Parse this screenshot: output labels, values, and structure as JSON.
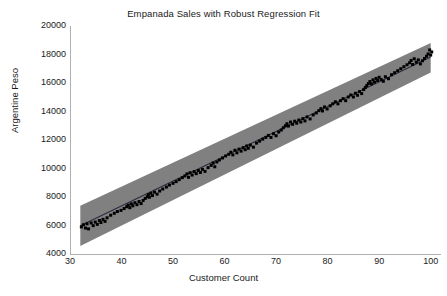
{
  "chart_data": {
    "type": "scatter",
    "title": "Empanada Sales with Robust Regression Fit",
    "xlabel": "Customer Count",
    "ylabel": "Argentine Peso",
    "xlim": [
      30,
      102
    ],
    "ylim": [
      4000,
      20000
    ],
    "xticks": [
      30,
      40,
      50,
      60,
      70,
      80,
      90,
      100
    ],
    "xtick_labels": [
      "30",
      "40",
      "50",
      "60",
      "70",
      "80",
      "90",
      "100"
    ],
    "yticks": [
      4000,
      6000,
      8000,
      10000,
      12000,
      14000,
      16000,
      18000,
      20000
    ],
    "ytick_labels": [
      "4000",
      "6000",
      "8000",
      "10000",
      "12000",
      "14000",
      "16000",
      "18000",
      "20000"
    ],
    "grid": false,
    "legend": null,
    "colors": {
      "band": "#808080",
      "point": "#000000",
      "line": "#2b2b3c",
      "axis": "#b0b0b0",
      "background": "#ffffff",
      "text": "#1a1a1a"
    },
    "series": [
      {
        "name": "Empanada sales observations",
        "type": "scatter",
        "marker": "square",
        "points": [
          [
            32.2,
            5900
          ],
          [
            32.6,
            6050
          ],
          [
            33.0,
            5820
          ],
          [
            33.3,
            6120
          ],
          [
            33.6,
            5760
          ],
          [
            34.1,
            6180
          ],
          [
            34.5,
            5990
          ],
          [
            34.9,
            6240
          ],
          [
            35.3,
            6080
          ],
          [
            35.7,
            6350
          ],
          [
            36.0,
            6210
          ],
          [
            36.4,
            6430
          ],
          [
            36.8,
            6290
          ],
          [
            37.2,
            6540
          ],
          [
            37.9,
            6720
          ],
          [
            38.6,
            6860
          ],
          [
            39.2,
            6980
          ],
          [
            39.9,
            7060
          ],
          [
            40.5,
            7190
          ],
          [
            41.0,
            7320
          ],
          [
            41.3,
            7430
          ],
          [
            41.6,
            7250
          ],
          [
            41.9,
            7520
          ],
          [
            42.2,
            7380
          ],
          [
            42.6,
            7600
          ],
          [
            43.0,
            7460
          ],
          [
            43.4,
            7680
          ],
          [
            43.8,
            7540
          ],
          [
            44.2,
            7760
          ],
          [
            44.6,
            7900
          ],
          [
            45.0,
            8020
          ],
          [
            45.2,
            8160
          ],
          [
            45.4,
            7980
          ],
          [
            45.7,
            8260
          ],
          [
            46.0,
            8100
          ],
          [
            46.4,
            8340
          ],
          [
            46.9,
            8200
          ],
          [
            47.4,
            8420
          ],
          [
            48.0,
            8560
          ],
          [
            48.7,
            8700
          ],
          [
            49.3,
            8840
          ],
          [
            50.0,
            8960
          ],
          [
            50.6,
            9080
          ],
          [
            51.2,
            9220
          ],
          [
            51.8,
            9360
          ],
          [
            52.3,
            9480
          ],
          [
            52.7,
            9620
          ],
          [
            53.0,
            9380
          ],
          [
            53.3,
            9700
          ],
          [
            53.7,
            9540
          ],
          [
            54.1,
            9780
          ],
          [
            54.5,
            9640
          ],
          [
            54.9,
            9860
          ],
          [
            55.3,
            9720
          ],
          [
            55.7,
            9940
          ],
          [
            56.2,
            9800
          ],
          [
            56.8,
            10060
          ],
          [
            57.4,
            10220
          ],
          [
            57.8,
            10380
          ],
          [
            58.1,
            10120
          ],
          [
            58.5,
            10460
          ],
          [
            59.0,
            10600
          ],
          [
            59.6,
            10740
          ],
          [
            60.2,
            10880
          ],
          [
            60.8,
            11000
          ],
          [
            61.2,
            11140
          ],
          [
            61.6,
            10960
          ],
          [
            62.0,
            11280
          ],
          [
            62.4,
            11100
          ],
          [
            62.8,
            11360
          ],
          [
            63.2,
            11220
          ],
          [
            63.6,
            11460
          ],
          [
            64.0,
            11320
          ],
          [
            64.3,
            11580
          ],
          [
            64.6,
            11420
          ],
          [
            65.0,
            11640
          ],
          [
            65.6,
            11500
          ],
          [
            66.2,
            11780
          ],
          [
            66.8,
            11920
          ],
          [
            67.4,
            12060
          ],
          [
            68.0,
            12180
          ],
          [
            68.5,
            12320
          ],
          [
            69.0,
            12180
          ],
          [
            69.5,
            12440
          ],
          [
            70.0,
            12300
          ],
          [
            70.5,
            12560
          ],
          [
            71.0,
            12700
          ],
          [
            71.4,
            12860
          ],
          [
            71.8,
            13000
          ],
          [
            72.1,
            13140
          ],
          [
            72.4,
            12980
          ],
          [
            72.8,
            13260
          ],
          [
            73.2,
            13100
          ],
          [
            73.6,
            13320
          ],
          [
            74.0,
            13180
          ],
          [
            74.4,
            13400
          ],
          [
            74.8,
            13260
          ],
          [
            75.2,
            13500
          ],
          [
            75.6,
            13340
          ],
          [
            76.0,
            13620
          ],
          [
            76.6,
            13480
          ],
          [
            77.2,
            13760
          ],
          [
            77.8,
            13900
          ],
          [
            78.3,
            14060
          ],
          [
            78.7,
            14200
          ],
          [
            79.0,
            14040
          ],
          [
            79.4,
            14320
          ],
          [
            79.9,
            14180
          ],
          [
            80.5,
            14400
          ],
          [
            81.0,
            14540
          ],
          [
            81.5,
            14680
          ],
          [
            82.0,
            14540
          ],
          [
            82.5,
            14760
          ],
          [
            83.0,
            14900
          ],
          [
            83.5,
            14760
          ],
          [
            84.0,
            15020
          ],
          [
            84.5,
            15160
          ],
          [
            85.0,
            15020
          ],
          [
            85.4,
            15280
          ],
          [
            85.8,
            15140
          ],
          [
            86.2,
            15400
          ],
          [
            86.6,
            15260
          ],
          [
            87.0,
            15540
          ],
          [
            87.3,
            15680
          ],
          [
            87.6,
            15820
          ],
          [
            87.9,
            15960
          ],
          [
            88.2,
            16100
          ],
          [
            88.5,
            15940
          ],
          [
            88.8,
            16220
          ],
          [
            89.1,
            16060
          ],
          [
            89.4,
            16320
          ],
          [
            89.7,
            16180
          ],
          [
            90.0,
            16400
          ],
          [
            90.4,
            16240
          ],
          [
            90.8,
            16120
          ],
          [
            91.2,
            16440
          ],
          [
            91.8,
            16300
          ],
          [
            92.4,
            16580
          ],
          [
            93.0,
            16720
          ],
          [
            93.6,
            16860
          ],
          [
            94.2,
            17000
          ],
          [
            94.8,
            17140
          ],
          [
            95.4,
            17280
          ],
          [
            95.9,
            17420
          ],
          [
            96.2,
            17580
          ],
          [
            96.5,
            17300
          ],
          [
            96.8,
            17700
          ],
          [
            97.2,
            17460
          ],
          [
            97.6,
            17620
          ],
          [
            98.0,
            17340
          ],
          [
            98.4,
            17560
          ],
          [
            98.8,
            17720
          ],
          [
            99.2,
            17880
          ],
          [
            99.5,
            18040
          ],
          [
            99.8,
            18320
          ],
          [
            100.0,
            17960
          ],
          [
            100.2,
            18180
          ]
        ]
      }
    ],
    "fit": {
      "name": "Robust regression fit",
      "type": "line",
      "x": [
        32,
        100
      ],
      "y": [
        5980,
        17820
      ],
      "slope": 174.1,
      "intercept": 406.8
    },
    "band": {
      "name": "Prediction band",
      "type": "area",
      "x": [
        32,
        100
      ],
      "lower": [
        4560,
        16740
      ],
      "upper": [
        7380,
        18800
      ],
      "fill": "#808080"
    }
  }
}
